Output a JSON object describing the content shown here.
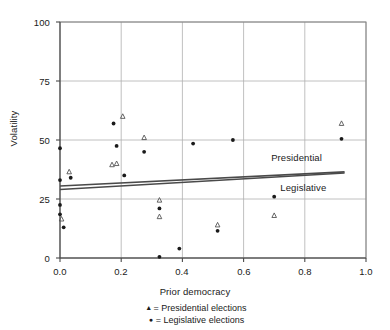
{
  "chart_data": {
    "type": "scatter",
    "title": "",
    "xlabel": "Prior democracy",
    "ylabel": "Volatility",
    "xlim": [
      0.0,
      1.0
    ],
    "ylim": [
      0,
      100
    ],
    "xticks": [
      "0.0",
      "0.2",
      "0.4",
      "0.6",
      "0.8",
      "1.0"
    ],
    "xtick_values": [
      0.0,
      0.2,
      0.4,
      0.6,
      0.8,
      1.0
    ],
    "yticks": [
      "0",
      "25",
      "50",
      "75",
      "100"
    ],
    "ytick_values": [
      0,
      25,
      50,
      75,
      100
    ],
    "grid": true,
    "legend_position": "below-axis",
    "series": [
      {
        "name": "Presidential elections",
        "marker": "triangle",
        "color": "#3a3a3a",
        "points": [
          [
            0.005,
            16.5
          ],
          [
            0.03,
            36.5
          ],
          [
            0.17,
            39.5
          ],
          [
            0.185,
            40.0
          ],
          [
            0.205,
            60.0
          ],
          [
            0.275,
            51.0
          ],
          [
            0.325,
            24.5
          ],
          [
            0.325,
            17.5
          ],
          [
            0.515,
            14.0
          ],
          [
            0.7,
            18.0
          ],
          [
            0.92,
            57.0
          ]
        ]
      },
      {
        "name": "Legislative elections",
        "marker": "circle",
        "color": "#1a1a1a",
        "points": [
          [
            0.0,
            46.5
          ],
          [
            0.0,
            33.0
          ],
          [
            0.0,
            22.5
          ],
          [
            0.0,
            18.5
          ],
          [
            0.012,
            13.0
          ],
          [
            0.035,
            34.0
          ],
          [
            0.175,
            57.0
          ],
          [
            0.185,
            47.5
          ],
          [
            0.21,
            35.0
          ],
          [
            0.275,
            45.0
          ],
          [
            0.325,
            21.0
          ],
          [
            0.325,
            0.5
          ],
          [
            0.39,
            4.0
          ],
          [
            0.435,
            48.5
          ],
          [
            0.515,
            11.5
          ],
          [
            0.565,
            50.0
          ],
          [
            0.7,
            26.0
          ],
          [
            0.92,
            50.5
          ]
        ]
      }
    ],
    "trend_lines": [
      {
        "name": "Presidential",
        "label": "Presidential",
        "color": "#4a4a4a",
        "x0": 0.0,
        "y0": 30.5,
        "x1": 0.93,
        "y1": 36.5,
        "label_x": 0.69,
        "label_y": 42.5
      },
      {
        "name": "Legislative",
        "label": "Legislative",
        "color": "#4a4a4a",
        "x0": 0.0,
        "y0": 29.0,
        "x1": 0.93,
        "y1": 36.0,
        "label_x": 0.72,
        "label_y": 29.5
      }
    ],
    "legend": [
      {
        "symbol": "▲",
        "text": "= Presidential elections"
      },
      {
        "symbol": "●",
        "text": "= Legislative elections"
      }
    ]
  },
  "axis": {
    "ylabel": "Volatility",
    "xlabel": "Prior democracy",
    "ytick_0": "0",
    "ytick_1": "25",
    "ytick_2": "50",
    "ytick_3": "75",
    "ytick_4": "100",
    "xtick_0": "0.0",
    "xtick_1": "0.2",
    "xtick_2": "0.4",
    "xtick_3": "0.6",
    "xtick_4": "0.8",
    "xtick_5": "1.0"
  },
  "annotations": {
    "presidential_line_label": "Presidential",
    "legislative_line_label": "Legislative"
  },
  "legend_text": {
    "presidential_symbol": "▲",
    "presidential_label": "= Presidential elections",
    "legislative_symbol": "●",
    "legislative_label": "= Legislative elections"
  },
  "colors": {
    "frame": "#808080",
    "grid": "#b0b0b0",
    "marker_dark": "#1a1a1a",
    "marker_tri": "#555555",
    "trend": "#4a4a4a"
  }
}
